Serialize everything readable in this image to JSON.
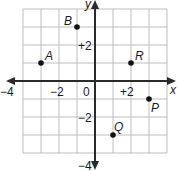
{
  "diagram": {
    "type": "coordinate-plane",
    "x_axis_label": "x",
    "y_axis_label": "y",
    "x_range": [
      -4,
      4
    ],
    "y_range": [
      -4,
      4
    ],
    "grid_step": 1,
    "tick_labels": {
      "x_neg4": "−4",
      "x_neg2": "−2",
      "origin": "0",
      "x_pos2": "+2",
      "y_pos2": "+2",
      "y_neg2": "−2",
      "y_neg4": "−4"
    },
    "points": [
      {
        "label": "A",
        "x": -3,
        "y": 1
      },
      {
        "label": "B",
        "x": -1,
        "y": 3
      },
      {
        "label": "R",
        "x": 2,
        "y": 1
      },
      {
        "label": "P",
        "x": 3,
        "y": -1
      },
      {
        "label": "Q",
        "x": 1,
        "y": -3
      }
    ],
    "colors": {
      "grid": "#b8b8b8",
      "axis": "#2a2a2a",
      "point": "#111111"
    }
  }
}
